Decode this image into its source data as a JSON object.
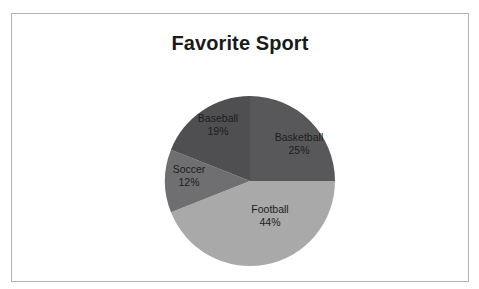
{
  "chart_data": {
    "type": "pie",
    "title": "Favorite Sport",
    "categories": [
      "Basketball",
      "Football",
      "Soccer",
      "Baseball"
    ],
    "values": [
      25,
      44,
      12,
      19
    ],
    "unit": "%",
    "labels": [
      {
        "name": "Basketball",
        "value": 25,
        "value_text": "25%",
        "color": "#58585a"
      },
      {
        "name": "Football",
        "value": 44,
        "value_text": "44%",
        "color": "#a9a9a9"
      },
      {
        "name": "Soccer",
        "value": 12,
        "value_text": "12%",
        "color": "#6f6f71"
      },
      {
        "name": "Baseball",
        "value": 19,
        "value_text": "19%",
        "color": "#4f4f51"
      }
    ],
    "start_angle_deg": 0,
    "direction": "clockwise",
    "legend": "none",
    "data_labels": "inside",
    "grid": false,
    "xlabel": "",
    "ylabel": ""
  },
  "frame": {
    "border_color": "#b4b4b4",
    "background": "#ffffff"
  }
}
